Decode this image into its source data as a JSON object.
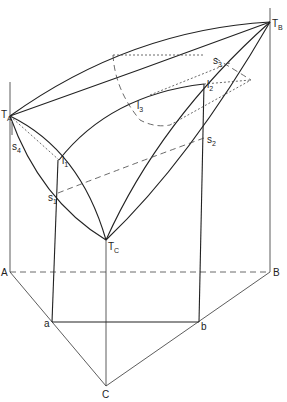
{
  "diagram": {
    "labels": {
      "TA": {
        "main": "T",
        "sub": "A"
      },
      "TB": {
        "main": "T",
        "sub": "B"
      },
      "TC": {
        "main": "T",
        "sub": "C"
      },
      "l1": {
        "main": "l",
        "sub": "1"
      },
      "l2": {
        "main": "l",
        "sub": "2"
      },
      "l3": {
        "main": "l",
        "sub": "3"
      },
      "s1": {
        "main": "s",
        "sub": "1"
      },
      "s2": {
        "main": "s",
        "sub": "2"
      },
      "s3": {
        "main": "s",
        "sub": "3"
      },
      "s4": {
        "main": "s",
        "sub": "4"
      },
      "A": "A",
      "B": "B",
      "C": "C",
      "a": "a",
      "b": "b"
    },
    "stroke_color": "#222222",
    "background": "#ffffff"
  }
}
